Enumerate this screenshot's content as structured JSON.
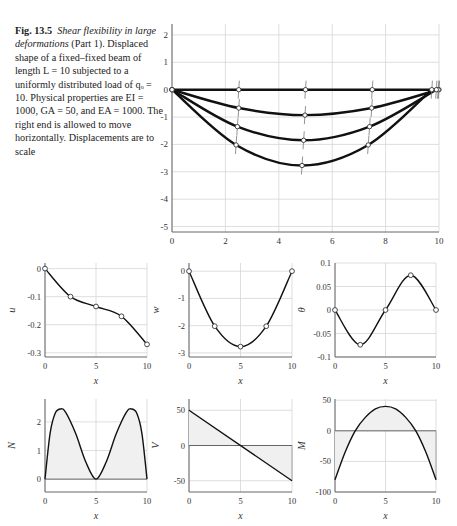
{
  "caption": {
    "fig_label": "Fig. 13.5",
    "title_italic": "Shear flexibility in large deformations",
    "part": "(Part 1).",
    "body": "Displaced shape of a fixed–fixed beam of length L = 10 subjected to a uniformly distributed load of qₒ = 10. Physical properties are EI = 1000, GA = 50, and EA = 1000. The right end is allowed to move horizontally. Displacements are to scale"
  },
  "chart_data": [
    {
      "id": "displaced-shape",
      "type": "line",
      "title": "",
      "xlabel": "",
      "ylabel": "",
      "xlim": [
        0,
        10
      ],
      "ylim": [
        -5.2,
        2.4
      ],
      "xticks": [
        0,
        2,
        4,
        6,
        8,
        10
      ],
      "yticks": [
        2,
        1,
        0,
        -1,
        -2,
        -3,
        -4,
        -5
      ],
      "grid": true,
      "series": [
        {
          "name": "load step 0",
          "x": [
            0,
            2.5,
            5,
            7.5,
            10
          ],
          "y": [
            0,
            0,
            0,
            0,
            0
          ]
        },
        {
          "name": "load step 1",
          "x": [
            0,
            2.5,
            4.98,
            7.48,
            9.97
          ],
          "y": [
            0,
            -0.67,
            -0.93,
            -0.67,
            0
          ]
        },
        {
          "name": "load step 2",
          "x": [
            0,
            2.45,
            4.93,
            7.4,
            9.9
          ],
          "y": [
            0,
            -1.35,
            -1.85,
            -1.35,
            0
          ]
        },
        {
          "name": "load step 3",
          "x": [
            0,
            2.4,
            4.87,
            7.35,
            9.73
          ],
          "y": [
            0,
            -2.02,
            -2.77,
            -2.02,
            0
          ]
        }
      ]
    },
    {
      "id": "u-plot",
      "type": "line",
      "xlabel": "x",
      "ylabel": "u",
      "xlim": [
        0,
        10
      ],
      "ylim": [
        -0.315,
        0.02
      ],
      "xticks": [
        0,
        5,
        10
      ],
      "yticks": [
        0,
        -0.1,
        -0.2,
        -0.3
      ],
      "grid": true,
      "x": [
        0,
        2.5,
        5,
        7.5,
        10
      ],
      "y": [
        0,
        -0.1,
        -0.135,
        -0.17,
        -0.27
      ]
    },
    {
      "id": "w-plot",
      "type": "line",
      "xlabel": "x",
      "ylabel": "w",
      "xlim": [
        0,
        10
      ],
      "ylim": [
        -3.15,
        0.3
      ],
      "xticks": [
        0,
        5,
        10
      ],
      "yticks": [
        0,
        -1,
        -2,
        -3
      ],
      "grid": true,
      "x": [
        0,
        2.5,
        5,
        7.5,
        10
      ],
      "y": [
        0,
        -2.02,
        -2.77,
        -2.02,
        0
      ]
    },
    {
      "id": "theta-plot",
      "type": "line",
      "xlabel": "x",
      "ylabel": "θ",
      "xlim": [
        0,
        10
      ],
      "ylim": [
        -0.1,
        0.1
      ],
      "xticks": [
        0,
        5,
        10
      ],
      "yticks": [
        0.1,
        0.05,
        0,
        -0.05,
        -0.1
      ],
      "grid": true,
      "x": [
        0,
        2.5,
        5,
        7.5,
        10
      ],
      "y": [
        0,
        -0.074,
        0,
        0.074,
        0
      ]
    },
    {
      "id": "N-plot",
      "type": "area",
      "xlabel": "x",
      "ylabel": "N",
      "xlim": [
        0,
        10
      ],
      "ylim": [
        -0.45,
        2.8
      ],
      "xticks": [
        0,
        5,
        10
      ],
      "yticks": [
        2,
        1,
        0
      ],
      "grid": true,
      "x": [
        0,
        0.5,
        1,
        1.5,
        2,
        3,
        4,
        5,
        6,
        7,
        8,
        8.5,
        9,
        9.5,
        10
      ],
      "y": [
        0,
        1.6,
        2.3,
        2.45,
        2.35,
        1.6,
        0.6,
        0,
        0.6,
        1.6,
        2.35,
        2.45,
        2.3,
        1.6,
        0
      ]
    },
    {
      "id": "V-plot",
      "type": "area",
      "xlabel": "x",
      "ylabel": "V",
      "xlim": [
        0,
        10
      ],
      "ylim": [
        -66,
        66
      ],
      "xticks": [
        0,
        5,
        10
      ],
      "yticks": [
        50,
        0,
        -50
      ],
      "grid": true,
      "x": [
        0,
        10
      ],
      "y": [
        50,
        -50
      ]
    },
    {
      "id": "M-plot",
      "type": "area",
      "xlabel": "x",
      "ylabel": "M",
      "xlim": [
        0,
        10
      ],
      "ylim": [
        -100,
        52
      ],
      "xticks": [
        0,
        5,
        10
      ],
      "yticks": [
        50,
        0,
        -50,
        -100
      ],
      "grid": true,
      "x": [
        0,
        1,
        2,
        3,
        4,
        5,
        6,
        7,
        8,
        9,
        10
      ],
      "y": [
        -80,
        -35,
        0,
        22,
        36,
        40,
        36,
        22,
        0,
        -35,
        -80
      ]
    }
  ]
}
